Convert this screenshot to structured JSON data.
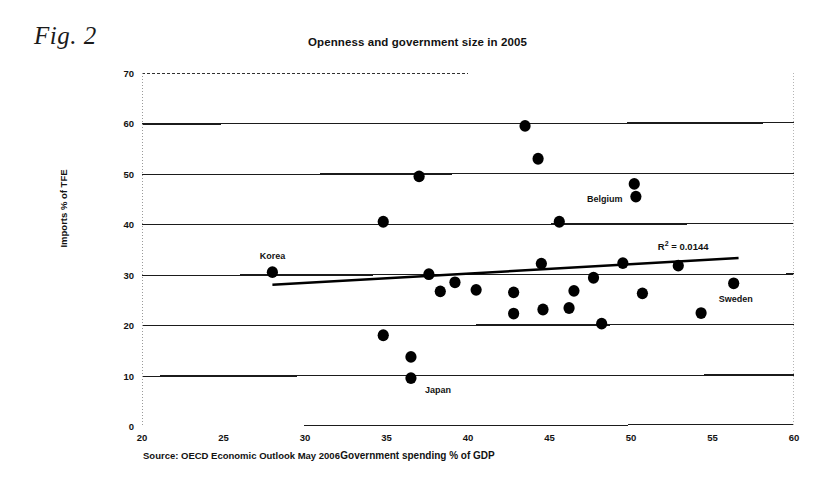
{
  "figure": {
    "caption": "Fig. 2",
    "source_note": "Source: OECD Economic Outlook May 2006"
  },
  "chart_data": {
    "type": "scatter",
    "title": "Openness and government size in 2005",
    "xlabel": "Government spending % of GDP",
    "ylabel": "Imports % of TFE",
    "xlim": [
      20,
      60
    ],
    "ylim": [
      0,
      70
    ],
    "xticks": [
      20,
      25,
      30,
      35,
      40,
      45,
      50,
      55,
      60
    ],
    "yticks": [
      0,
      10,
      20,
      30,
      40,
      50,
      60,
      70
    ],
    "grid": "horizontal",
    "legend": "none",
    "marker_color": "#000000",
    "points": [
      {
        "x": 28.0,
        "y": 30.5,
        "label": "Korea",
        "label_pos": "above"
      },
      {
        "x": 34.8,
        "y": 40.5,
        "label": "",
        "label_pos": ""
      },
      {
        "x": 34.8,
        "y": 18.0,
        "label": "",
        "label_pos": ""
      },
      {
        "x": 36.5,
        "y": 13.7,
        "label": "",
        "label_pos": ""
      },
      {
        "x": 36.5,
        "y": 9.5,
        "label": "Japan",
        "label_pos": "right-below"
      },
      {
        "x": 37.0,
        "y": 49.5,
        "label": "",
        "label_pos": ""
      },
      {
        "x": 37.6,
        "y": 30.1,
        "label": "",
        "label_pos": ""
      },
      {
        "x": 38.3,
        "y": 26.7,
        "label": "",
        "label_pos": ""
      },
      {
        "x": 39.2,
        "y": 28.5,
        "label": "",
        "label_pos": ""
      },
      {
        "x": 40.5,
        "y": 27.0,
        "label": "",
        "label_pos": ""
      },
      {
        "x": 42.8,
        "y": 26.5,
        "label": "",
        "label_pos": ""
      },
      {
        "x": 42.8,
        "y": 22.3,
        "label": "",
        "label_pos": ""
      },
      {
        "x": 43.5,
        "y": 59.5,
        "label": "",
        "label_pos": ""
      },
      {
        "x": 44.3,
        "y": 53.0,
        "label": "",
        "label_pos": ""
      },
      {
        "x": 44.5,
        "y": 32.2,
        "label": "",
        "label_pos": ""
      },
      {
        "x": 44.6,
        "y": 23.1,
        "label": "",
        "label_pos": ""
      },
      {
        "x": 45.6,
        "y": 40.5,
        "label": "",
        "label_pos": ""
      },
      {
        "x": 46.2,
        "y": 23.4,
        "label": "",
        "label_pos": ""
      },
      {
        "x": 46.5,
        "y": 26.8,
        "label": "",
        "label_pos": ""
      },
      {
        "x": 47.7,
        "y": 29.4,
        "label": "",
        "label_pos": ""
      },
      {
        "x": 48.2,
        "y": 20.3,
        "label": "",
        "label_pos": ""
      },
      {
        "x": 49.5,
        "y": 32.3,
        "label": "",
        "label_pos": ""
      },
      {
        "x": 50.2,
        "y": 48.0,
        "label": "",
        "label_pos": ""
      },
      {
        "x": 50.3,
        "y": 45.5,
        "label": "Belgium",
        "label_pos": "left"
      },
      {
        "x": 50.7,
        "y": 26.3,
        "label": "",
        "label_pos": ""
      },
      {
        "x": 52.9,
        "y": 31.8,
        "label": "",
        "label_pos": ""
      },
      {
        "x": 54.3,
        "y": 22.4,
        "label": "",
        "label_pos": ""
      },
      {
        "x": 56.3,
        "y": 28.3,
        "label": "Sweden",
        "label_pos": "below"
      }
    ],
    "trendline": {
      "x0": 28.0,
      "y0": 28.0,
      "x1": 56.6,
      "y1": 33.3,
      "color": "#000000"
    },
    "annotations": [
      {
        "name": "r2",
        "prefix": "R",
        "sup": "2",
        "text": " = 0.0144",
        "x": 53.2,
        "y": 35.6
      }
    ]
  }
}
